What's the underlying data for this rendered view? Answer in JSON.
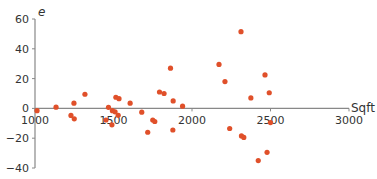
{
  "chart_data": {
    "type": "scatter",
    "title": "",
    "xlabel": "Sqft",
    "ylabel": "e",
    "xlim": [
      1000,
      3000
    ],
    "ylim": [
      -40,
      60
    ],
    "x_ticks": [
      1000,
      1500,
      2000,
      2500,
      3000
    ],
    "y_ticks": [
      -40,
      -20,
      0,
      20,
      40,
      60
    ],
    "grid": false,
    "legend": null,
    "marker_color": "#e0502a",
    "axis_color": "#888888",
    "series": [
      {
        "name": "residuals",
        "points": [
          [
            1013,
            -1.5
          ],
          [
            1134,
            0.8
          ],
          [
            1229,
            -4.7
          ],
          [
            1250,
            -7
          ],
          [
            1248,
            3.5
          ],
          [
            1318,
            9.5
          ],
          [
            1452,
            -7.8
          ],
          [
            1468,
            0.7
          ],
          [
            1490,
            -11
          ],
          [
            1493,
            -1.5
          ],
          [
            1510,
            -2.3
          ],
          [
            1515,
            7.5
          ],
          [
            1535,
            6.5
          ],
          [
            1530,
            -4.6
          ],
          [
            1606,
            3.5
          ],
          [
            1680,
            -2.5
          ],
          [
            1718,
            -16
          ],
          [
            1750,
            -7.8
          ],
          [
            1763,
            -8.8
          ],
          [
            1793,
            11
          ],
          [
            1822,
            10
          ],
          [
            1863,
            27
          ],
          [
            1878,
            -14.5
          ],
          [
            1880,
            5
          ],
          [
            1940,
            1.5
          ],
          [
            2172,
            29.5
          ],
          [
            2210,
            18
          ],
          [
            2240,
            -13.5
          ],
          [
            2312,
            51.5
          ],
          [
            2315,
            -18.5
          ],
          [
            2330,
            -19.5
          ],
          [
            2375,
            7
          ],
          [
            2422,
            -35
          ],
          [
            2465,
            22.5
          ],
          [
            2478,
            -29.5
          ],
          [
            2492,
            10.5
          ],
          [
            2500,
            -9.5
          ]
        ]
      }
    ]
  }
}
